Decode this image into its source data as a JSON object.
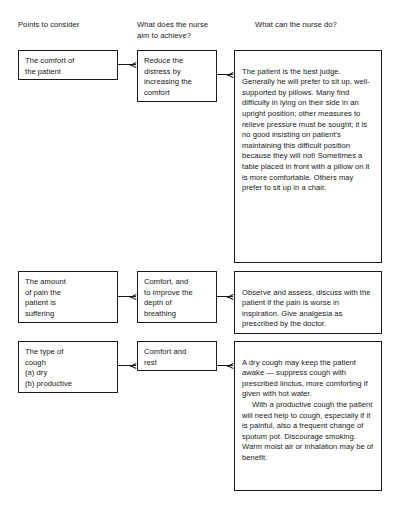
{
  "headers": [
    {
      "id": "points",
      "label": "Points to consider"
    },
    {
      "id": "aim",
      "label": "What does the nurse\naim to achieve?"
    },
    {
      "id": "action",
      "label": "What can the nurse do?"
    }
  ],
  "rows": [
    {
      "id": "comfort",
      "point": "The comfort of\nthe patient",
      "aim": "Reduce the\ndistress by\nincreasing the\ncomfort",
      "action_part1": "The patient is the best judge. Generally he will prefer to sit up, well-supported by pillows. Many find difficulty in lying on their side in an upright position; other measures to relieve pressure must be sought; it is no good insisting on patient's maintaining this difficult position because they will not! Sometimes a table placed in front with a pillow on it is more comfortable. Others may prefer to sit up in a chair.",
      "action_part2": ""
    },
    {
      "id": "pain",
      "point": "The amount\nof pain the\npatient is\nsuffering",
      "aim": "Comfort, and\nto improve the\ndepth of\nbreathing",
      "action_part1": "Observe and assess, discuss with the patient if the pain is worse in inspiration. Give analgesia as prescribed by the doctor.",
      "action_part2": ""
    },
    {
      "id": "cough",
      "point": "The type of\ncough\n(a) dry\n(b) productive",
      "aim": "Comfort and\nrest",
      "action_part1": "A dry cough may keep the patient awake — suppress cough with prescribed linctus, more comforting if given with hot water.",
      "action_part2": "With a productive cough the patient will need help to cough, especially if it is painful, also a frequent change of sputum pot. Discourage smoking. Warm moist air or inhalation may be of benefit."
    }
  ],
  "arrows": {
    "glyph": "arrow-right",
    "count": 6
  },
  "colors": {
    "text": "#16181a",
    "border": "#1a1a1a",
    "background": "#ffffff"
  }
}
